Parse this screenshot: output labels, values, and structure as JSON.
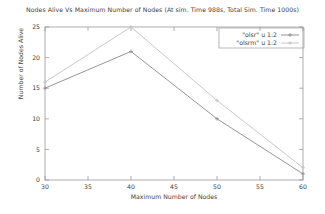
{
  "chart_data": {
    "type": "line",
    "title": "Nodes Alive Vs Maximum Number of Nodes (At sim. Time 988s, Total Sim. Time 1000s)",
    "xlabel": "Maximum Number of Nodes",
    "ylabel": "Number of Nodes Alive",
    "x": [
      30,
      40,
      50,
      60
    ],
    "xlim": [
      30,
      60
    ],
    "ylim": [
      0,
      25
    ],
    "xticks": [
      "30",
      "35",
      "40",
      "45",
      "50",
      "55",
      "60"
    ],
    "xtick_values": [
      30,
      35,
      40,
      45,
      50,
      55,
      60
    ],
    "yticks": [
      "0",
      "5",
      "10",
      "15",
      "20",
      "25"
    ],
    "ytick_values": [
      0,
      5,
      10,
      15,
      20,
      25
    ],
    "grid": false,
    "legend_position": "top-right",
    "series": [
      {
        "name": "\"olsr\" u 1:2",
        "color": "#8a8a8a",
        "values": [
          15,
          21,
          10,
          1
        ]
      },
      {
        "name": "\"olsrm\" u 1:2",
        "color": "#c2c2c2",
        "values": [
          16,
          25,
          13,
          2
        ]
      }
    ]
  },
  "axes": {
    "frame_color": "#9a9a9a"
  }
}
